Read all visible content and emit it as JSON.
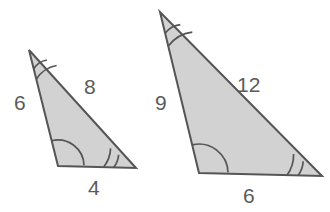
{
  "figure": {
    "background_color": "#ffffff",
    "fill_color": "#d2d2d2",
    "stroke_color": "#555555",
    "label_color": "#5b5b5b",
    "stroke_width": 2
  },
  "shapes": [
    {
      "name": "small-triangle",
      "vertices": {
        "apex": [
          29,
          50
        ],
        "bottom_left": [
          58,
          166
        ],
        "bottom_right": [
          136,
          168
        ]
      },
      "sides": [
        {
          "name": "left-side",
          "label": "6",
          "label_x": 14,
          "label_y": 92
        },
        {
          "name": "hypotenuse-side",
          "label": "8",
          "label_x": 84,
          "label_y": 76
        },
        {
          "name": "base-side",
          "label": "4",
          "label_x": 88,
          "label_y": 177
        }
      ],
      "angles": [
        {
          "name": "apex-angle",
          "arcs": 2
        },
        {
          "name": "bottom-left-angle",
          "arcs": 1
        },
        {
          "name": "bottom-right-angle",
          "arcs": 2
        }
      ]
    },
    {
      "name": "large-triangle",
      "vertices": {
        "apex": [
          160,
          12
        ],
        "bottom_left": [
          199,
          173
        ],
        "bottom_right": [
          322,
          176
        ]
      },
      "sides": [
        {
          "name": "left-side",
          "label": "9",
          "label_x": 155,
          "label_y": 92
        },
        {
          "name": "hypotenuse-side",
          "label": "12",
          "label_x": 237,
          "label_y": 74
        },
        {
          "name": "base-side",
          "label": "6",
          "label_x": 243,
          "label_y": 185
        }
      ],
      "angles": [
        {
          "name": "apex-angle",
          "arcs": 2
        },
        {
          "name": "bottom-left-angle",
          "arcs": 1
        },
        {
          "name": "bottom-right-angle",
          "arcs": 2
        }
      ]
    }
  ],
  "labels": {
    "small_left": "6",
    "small_hyp": "8",
    "small_base": "4",
    "large_left": "9",
    "large_hyp": "12",
    "large_base": "6"
  }
}
